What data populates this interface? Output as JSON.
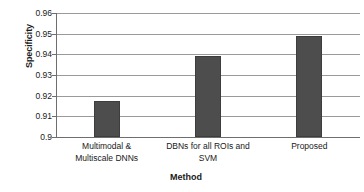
{
  "chart_data": {
    "type": "bar",
    "title": "",
    "xlabel": "Method",
    "ylabel": "Specificity",
    "categories": [
      "Multimodal & Multiscale DNNs",
      "DBNs for all ROIs and SVM",
      "Proposed"
    ],
    "category_lines": [
      [
        "Multimodal &",
        "Multiscale DNNs"
      ],
      [
        "DBNs for all ROIs and",
        "SVM"
      ],
      [
        "Proposed"
      ]
    ],
    "values": [
      0.9175,
      0.9393,
      0.9488
    ],
    "ylim": [
      0.9,
      0.96
    ],
    "ytick_labels": [
      "0.9",
      "0.91",
      "0.92",
      "0.93",
      "0.94",
      "0.95",
      "0.96"
    ],
    "ytick_values": [
      0.9,
      0.91,
      0.92,
      0.93,
      0.94,
      0.95,
      0.96
    ],
    "grid": true,
    "grid_axis": "y",
    "legend": false,
    "legend_position": "none",
    "bar_color": "#4d4d4d",
    "bar_border_color": "#3d3d3d",
    "gridline_color": "#9a9a9a",
    "axis_color": "#6e6e6e",
    "background_color": "#ffffff",
    "text_color": "#1a1a1a"
  }
}
